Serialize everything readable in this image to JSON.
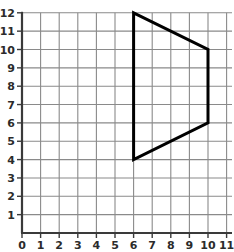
{
  "chart_data": {
    "type": "line",
    "title": "",
    "xlabel": "",
    "ylabel": "",
    "grid": true,
    "legend": false,
    "xlim": [
      0,
      11
    ],
    "ylim": [
      0,
      12
    ],
    "x_ticks": [
      "0",
      "1",
      "2",
      "3",
      "4",
      "5",
      "6",
      "7",
      "8",
      "9",
      "10",
      "11"
    ],
    "y_ticks": [
      "1",
      "2",
      "3",
      "4",
      "5",
      "6",
      "7",
      "8",
      "9",
      "10",
      "11",
      "12"
    ],
    "shapes": [
      {
        "name": "trapezoid",
        "closed": true,
        "stroke": "#000000",
        "stroke_width": 3,
        "fill": "none",
        "points": [
          {
            "x": 6,
            "y": 12
          },
          {
            "x": 10,
            "y": 10
          },
          {
            "x": 10,
            "y": 6
          },
          {
            "x": 6,
            "y": 4
          }
        ]
      }
    ]
  },
  "colors": {
    "grid": "#8a8a8a",
    "axis": "#3a3a3a",
    "shape": "#000000",
    "label": "#2b2b2b",
    "background": "#ffffff"
  },
  "geometry": {
    "origin_x": 22,
    "origin_y": 233,
    "step_x": 18.6,
    "step_y": 18.35
  }
}
